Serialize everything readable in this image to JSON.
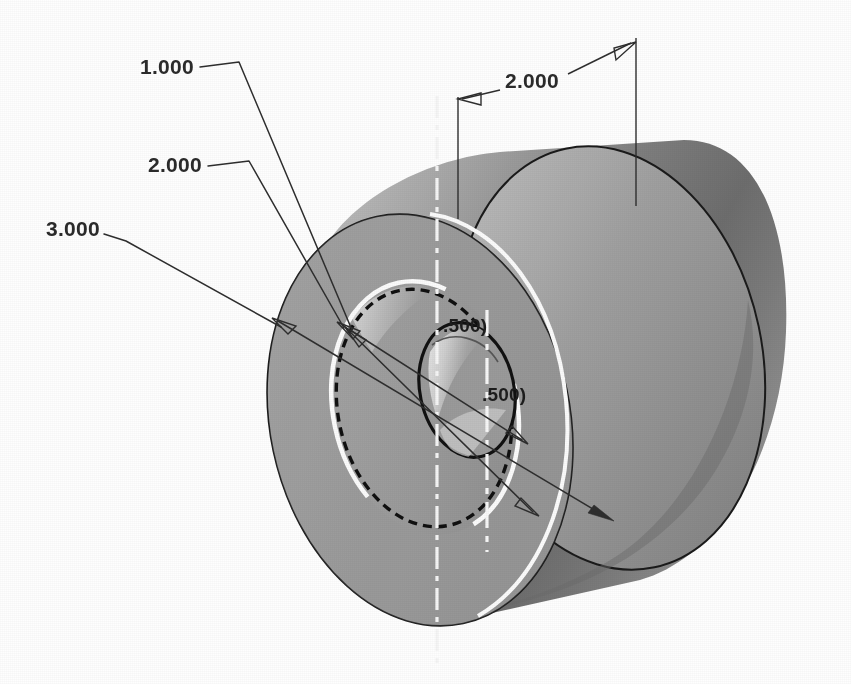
{
  "document": {
    "title": "Isometric Dimensioned Cylinder",
    "background_color": "#ffffff"
  },
  "colors": {
    "line": "#2e2e2e",
    "hidden_line": "#101010",
    "highlight": "#fbfbfb",
    "body_light": "#b9b9b9",
    "body_mid": "#9a9a9a",
    "body_dark": "#6f6f6f",
    "face_gray": "#9e9e9e",
    "bore_highlight": "#d9d9d9"
  },
  "dimensions": {
    "leader_callouts": [
      {
        "id": "dim-1-000",
        "label": "1.000",
        "text_x": 140,
        "text_y": 74,
        "shoulder": "M 200 66 L 238 62",
        "leader_path": "M 238 62 L 352 330",
        "arrow_tip_x": 352,
        "arrow_tip_y": 330,
        "arrow_angle": 67
      },
      {
        "id": "dim-2-000-left",
        "label": "2.000",
        "text_x": 148,
        "text_y": 172,
        "shoulder": "M 208 165 L 248 162",
        "leader_path": "M 248 162 L 345 330",
        "arrow_tip_x": 345,
        "arrow_tip_y": 330,
        "arrow_angle": 60
      },
      {
        "id": "dim-3-000",
        "label": "3.000",
        "text_x": 46,
        "text_y": 236,
        "shoulder": "M 104 233 L 124 240",
        "leader_path": "M 124 240 L 282 328",
        "arrow_tip_x": 282,
        "arrow_tip_y": 328,
        "arrow_angle": 29
      }
    ],
    "linear_dimension": {
      "id": "dim-2-000-top",
      "label": "2.000",
      "text_x": 505,
      "text_y": 88,
      "left_ext_line": "M 458 97 L 458 219",
      "right_ext_line": "M 636 40 L 636 205",
      "dim_line_left": "M 462 99 L 500 90",
      "dim_line_right": "M 566 74 L 632 43",
      "left_arrow_tip_x": 459,
      "left_arrow_tip_y": 99,
      "right_arrow_tip_x": 635,
      "right_arrow_tip_y": 42
    },
    "reference_dimensions": [
      {
        "id": "ref-500-upper",
        "label": ".500)",
        "text_x": 443,
        "text_y": 332
      },
      {
        "id": "ref-500-lower",
        "label": ".500)",
        "text_x": 482,
        "text_y": 401
      }
    ]
  },
  "geometry": {
    "part_type": "counterbored cylinder, isometric shaded view",
    "cylinder_back_face": {
      "cx": 600,
      "cy": 350,
      "rx": 152,
      "ry": 212,
      "rotation": -12
    },
    "cylinder_front_face": {
      "cx": 420,
      "cy": 420,
      "rx": 150,
      "ry": 208,
      "rotation": -12
    },
    "counterbore_circle": {
      "cx": 425,
      "cy": 408,
      "rx": 92,
      "ry": 128,
      "rotation": -12
    },
    "hidden_circle": {
      "cx": 424,
      "cy": 408,
      "rx": 78,
      "ry": 110,
      "rotation": -12
    },
    "bore_circle": {
      "cx": 467,
      "cy": 390,
      "rx": 47,
      "ry": 68,
      "rotation": -12
    },
    "centerlines": [
      {
        "id": "centerline-vertical-left",
        "path": "M 437 96 L 437 668"
      },
      {
        "id": "centerline-vertical-right",
        "path": "M 487 315 L 487 545"
      }
    ]
  },
  "axis_leaders": {
    "diameter_leaders": [
      {
        "id": "diameter-leader-outer",
        "path": "M 272 318 L 612 520",
        "arrow_start_x": 282,
        "arrow_start_y": 324,
        "arrow_end_x": 606,
        "arrow_end_y": 516
      },
      {
        "id": "diameter-leader-middle",
        "path": "M 338 322 L 536 515",
        "arrow_start_x": 346,
        "arrow_start_y": 328,
        "arrow_end_x": 530,
        "arrow_end_y": 508
      },
      {
        "id": "diameter-leader-bore",
        "path": "M 347 328 L 525 442",
        "arrow_start_x": 352,
        "arrow_start_y": 331,
        "arrow_end_x": 520,
        "arrow_end_y": 438
      }
    ]
  }
}
